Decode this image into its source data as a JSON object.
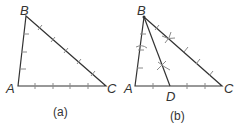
{
  "figures": [
    {
      "caption": "(a)",
      "vertices": {
        "A": "A",
        "B": "B",
        "C": "C"
      }
    },
    {
      "caption": "(b)",
      "vertices": {
        "A": "A",
        "B": "B",
        "C": "C",
        "D": "D"
      }
    }
  ],
  "colors": {
    "line": "#333333",
    "tick": "#8a8a8a",
    "text": "#333333"
  }
}
